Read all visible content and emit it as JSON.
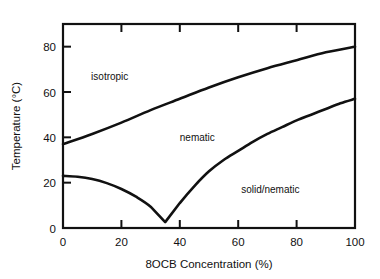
{
  "figure": {
    "top_cropped_text": "▪▪▪▪▪ ▪▪▪▪▪▪▪▪▪▪▪▪▪▪",
    "corner_cropped_text": "▪▪"
  },
  "chart_data": {
    "type": "line",
    "title": "",
    "xlabel": "8OCB Concentration   (%)",
    "ylabel": "Temperature  (°C)",
    "xlim": [
      0,
      100
    ],
    "ylim": [
      0,
      90
    ],
    "xticks": [
      0,
      20,
      40,
      60,
      80,
      100
    ],
    "yticks": [
      0,
      20,
      40,
      60,
      80
    ],
    "xtick_labels": [
      "0",
      "20",
      "40",
      "60",
      "80",
      "100"
    ],
    "ytick_labels": [
      "0",
      "20",
      "40",
      "60",
      "80"
    ],
    "grid": false,
    "legend": "none",
    "annotations": [
      {
        "text": "isotropic",
        "x": 16,
        "y": 67
      },
      {
        "text": "nematic",
        "x": 46,
        "y": 40
      },
      {
        "text": "solid/nematic",
        "x": 71,
        "y": 17
      }
    ],
    "series": [
      {
        "name": "nematic-isotropic transition",
        "points": [
          {
            "x": 0,
            "y": 37
          },
          {
            "x": 10,
            "y": 41.5
          },
          {
            "x": 20,
            "y": 46.5
          },
          {
            "x": 30,
            "y": 52
          },
          {
            "x": 40,
            "y": 57
          },
          {
            "x": 50,
            "y": 62
          },
          {
            "x": 60,
            "y": 66.5
          },
          {
            "x": 70,
            "y": 70.5
          },
          {
            "x": 80,
            "y": 74
          },
          {
            "x": 90,
            "y": 77.5
          },
          {
            "x": 100,
            "y": 80
          }
        ]
      },
      {
        "name": "solidus / melting line (eutectic)",
        "points": [
          {
            "x": 0,
            "y": 23
          },
          {
            "x": 5,
            "y": 22.6
          },
          {
            "x": 10,
            "y": 21.6
          },
          {
            "x": 15,
            "y": 19.8
          },
          {
            "x": 20,
            "y": 17.2
          },
          {
            "x": 25,
            "y": 13.8
          },
          {
            "x": 30,
            "y": 9.4
          },
          {
            "x": 35,
            "y": 2.6
          },
          {
            "x": 40,
            "y": 11
          },
          {
            "x": 45,
            "y": 18.5
          },
          {
            "x": 50,
            "y": 25
          },
          {
            "x": 55,
            "y": 30
          },
          {
            "x": 60,
            "y": 34
          },
          {
            "x": 65,
            "y": 38
          },
          {
            "x": 70,
            "y": 41.5
          },
          {
            "x": 75,
            "y": 44.5
          },
          {
            "x": 80,
            "y": 47.5
          },
          {
            "x": 85,
            "y": 50
          },
          {
            "x": 90,
            "y": 52.5
          },
          {
            "x": 95,
            "y": 55
          },
          {
            "x": 100,
            "y": 57
          }
        ]
      }
    ],
    "eutectic_point": {
      "x": 35,
      "y": 2.6
    }
  }
}
